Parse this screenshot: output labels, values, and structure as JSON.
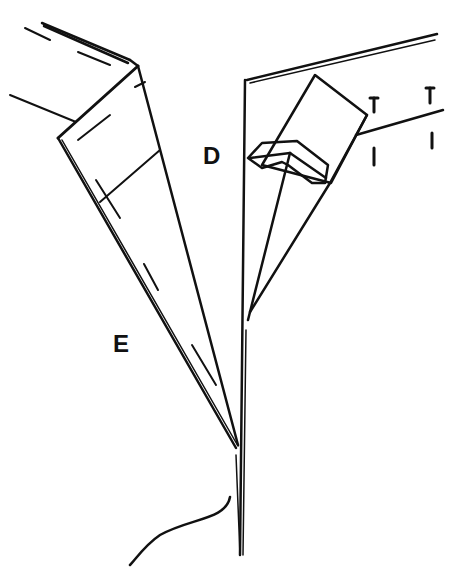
{
  "diagram": {
    "labels": {
      "d": "D",
      "e": "E"
    },
    "marks": {
      "notch_symbols": [
        "T",
        "I",
        "T",
        "I"
      ]
    },
    "colors": {
      "ink": "#111111",
      "background": "#ffffff"
    }
  }
}
